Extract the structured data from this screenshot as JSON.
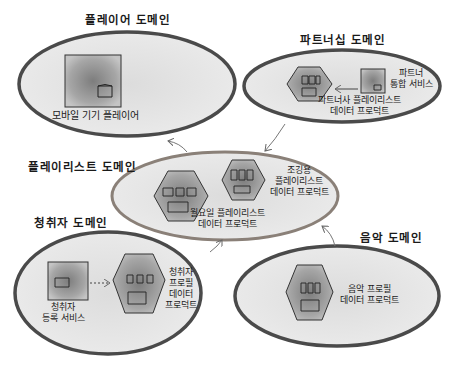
{
  "diagram": {
    "type": "domain-diagram",
    "colors": {
      "ellipse_border": "#4a4a4a",
      "center_ellipse_border": "#8a8078",
      "ellipse_fill": "#e6e6e6",
      "shape_fill": "#9a9a9a",
      "arrow": "#777777"
    },
    "domains": [
      {
        "id": "player",
        "title": "플레이어 도메인",
        "components": [
          {
            "kind": "service-box",
            "label": "모바일 기기 플레이어"
          }
        ]
      },
      {
        "id": "partnership",
        "title": "파트너십 도메인",
        "components": [
          {
            "kind": "data-product-hexagon",
            "label_line1": "파트너사 플레이리스트",
            "label_line2": "데이터 프로덕트"
          },
          {
            "kind": "service-box",
            "label_line1": "파트너",
            "label_line2": "통합 서비스"
          }
        ]
      },
      {
        "id": "playlist",
        "title": "플레이리스트 도메인",
        "components": [
          {
            "kind": "data-product-hexagon",
            "label_line1": "월요일 플레이리스트",
            "label_line2": "데이터 프로덕트"
          },
          {
            "kind": "data-product-hexagon",
            "label_line1": "조깅용",
            "label_line2": "플레이리스트",
            "label_line3": "데이터 프로덕트"
          }
        ]
      },
      {
        "id": "listener",
        "title": "청취자 도메인",
        "components": [
          {
            "kind": "service-box",
            "label_line1": "청취자",
            "label_line2": "등록 서비스"
          },
          {
            "kind": "data-product-hexagon",
            "label_line1": "청취자",
            "label_line2": "프로필",
            "label_line3": "데이터",
            "label_line4": "프로덕트"
          }
        ]
      },
      {
        "id": "music",
        "title": "음악 도메인",
        "components": [
          {
            "kind": "data-product-hexagon",
            "label_line1": "음악 프로필",
            "label_line2": "데이터 프로덕트"
          }
        ]
      }
    ],
    "edges": [
      {
        "from": "partnership.service",
        "to": "partnership.hexagon",
        "style": "solid-arrow"
      },
      {
        "from": "listener.service",
        "to": "listener.hexagon",
        "style": "dashed-arrow"
      },
      {
        "from": "playlist",
        "to": "player",
        "style": "curved-arrow"
      },
      {
        "from": "partnership",
        "to": "playlist",
        "style": "curved-arrow"
      },
      {
        "from": "listener",
        "to": "playlist",
        "style": "curved-arrow"
      },
      {
        "from": "music",
        "to": "playlist",
        "style": "curved-arrow"
      }
    ]
  }
}
